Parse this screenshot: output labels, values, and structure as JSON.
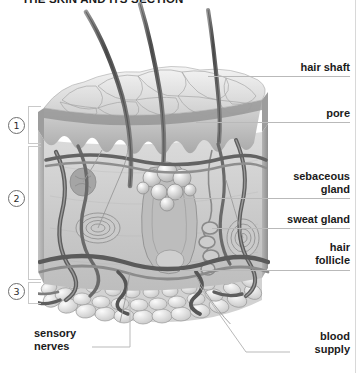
{
  "figure": {
    "title": "THE SKIN AND ITS SECTION",
    "type": "anatomical-illustration",
    "style": "grayscale pencil rendering"
  },
  "layer_markers": [
    {
      "id": "1",
      "glyph": "①",
      "name": "epidermis-marker"
    },
    {
      "id": "2",
      "glyph": "②",
      "name": "dermis-marker"
    },
    {
      "id": "3",
      "glyph": "③",
      "name": "subcutaneous-marker"
    }
  ],
  "labels": {
    "hair_shaft": "hair shaft",
    "pore": "pore",
    "sebaceous_gland_line1": "sebaceous",
    "sebaceous_gland_line2": "gland",
    "sweat_gland": "sweat gland",
    "hair_follicle_line1": "hair",
    "hair_follicle_line2": "follicle",
    "sensory_nerves_line1": "sensory",
    "sensory_nerves_line2": "nerves",
    "blood_supply_line1": "blood",
    "blood_supply_line2": "supply"
  },
  "colors": {
    "text": "#1b1b1b",
    "leader_line": "#b9b9b9",
    "bracket": "#c9c9c9",
    "background": "#ffffff",
    "ink_dark": "#4a4a4a",
    "ink_mid": "#8d8d8d",
    "ink_light": "#d4d4d4"
  }
}
